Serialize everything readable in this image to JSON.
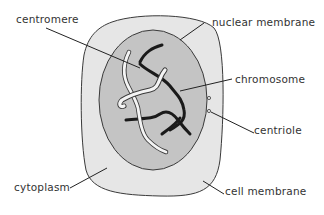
{
  "diagram": {
    "colors": {
      "background": "#ffffff",
      "cytoplasm": "#e6e6e6",
      "nucleoplasm": "#c4c4c4",
      "outline": "#3a3a3a",
      "chromosome_dark": "#1a1a1a",
      "chromosome_light": "#f4f4f4",
      "label_text": "#333333"
    },
    "labels": {
      "centromere": "centromere",
      "nuclear_membrane": "nuclear membrane",
      "chromosome": "chromosome",
      "centriole": "centriole",
      "cytoplasm": "cytoplasm",
      "cell_membrane": "cell membrane"
    }
  }
}
